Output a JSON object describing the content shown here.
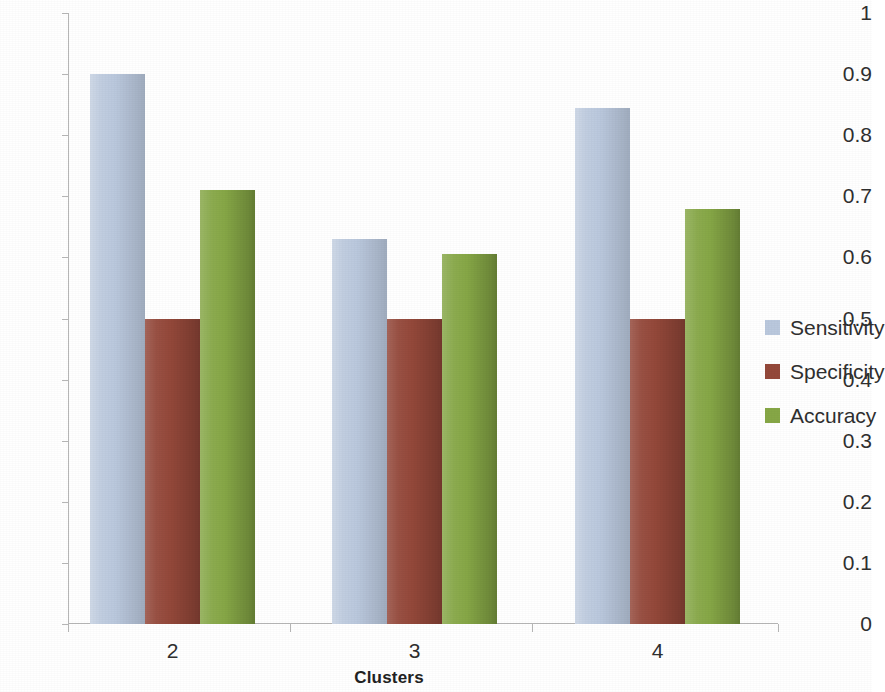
{
  "chart_data": {
    "type": "bar",
    "title": "",
    "xlabel": "Clusters",
    "ylabel": "",
    "categories": [
      "2",
      "3",
      "4"
    ],
    "series": [
      {
        "name": "Sensitivity",
        "color": "#bac8dd",
        "values": [
          0.9,
          0.63,
          0.845
        ]
      },
      {
        "name": "Specificity",
        "color": "#94483a",
        "values": [
          0.5,
          0.5,
          0.5
        ]
      },
      {
        "name": "Accuracy",
        "color": "#86a746",
        "values": [
          0.71,
          0.605,
          0.68
        ]
      }
    ],
    "ylim": [
      0,
      1
    ],
    "y_ticks": [
      "0",
      "0.1",
      "0.2",
      "0.3",
      "0.4",
      "0.5",
      "0.6",
      "0.7",
      "0.8",
      "0.9",
      "1"
    ],
    "y_tick_values": [
      0,
      0.1,
      0.2,
      0.3,
      0.4,
      0.5,
      0.6,
      0.7,
      0.8,
      0.9,
      1
    ],
    "grid": false,
    "legend_position": "right"
  },
  "axis": {
    "x_title": "Clusters"
  },
  "legend": {
    "items": [
      {
        "label": "Sensitivity"
      },
      {
        "label": "Specificity"
      },
      {
        "label": "Accuracy"
      }
    ]
  }
}
